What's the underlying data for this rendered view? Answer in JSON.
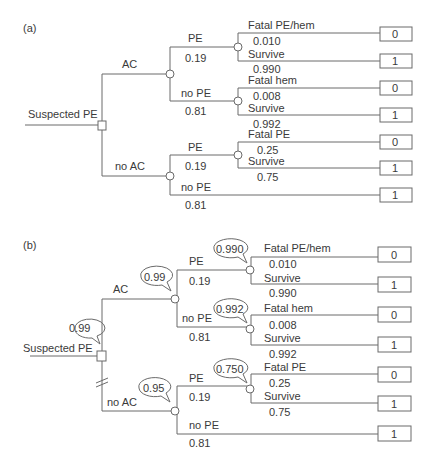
{
  "panels": [
    {
      "label": "(a)",
      "root": "Suspected PE",
      "decision": {
        "branches": [
          {
            "label": "AC"
          },
          {
            "label": "no AC"
          }
        ]
      },
      "ac": {
        "pe": {
          "label": "PE",
          "prob": "0.19",
          "outcomes": [
            {
              "label": "Fatal PE/hem",
              "prob": "0.010",
              "value": "0"
            },
            {
              "label": "Survive",
              "prob": "0.990",
              "value": "1"
            }
          ]
        },
        "nope": {
          "label": "no PE",
          "prob": "0.81",
          "outcomes": [
            {
              "label": "Fatal hem",
              "prob": "0.008",
              "value": "0"
            },
            {
              "label": "Survive",
              "prob": "0.992",
              "value": "1"
            }
          ]
        }
      },
      "noac": {
        "pe": {
          "label": "PE",
          "prob": "0.19",
          "outcomes": [
            {
              "label": "Fatal PE",
              "prob": "0.25",
              "value": "0"
            },
            {
              "label": "Survive",
              "prob": "0.75",
              "value": "1"
            }
          ]
        },
        "nope": {
          "label": "no PE",
          "prob": "0.81",
          "value": "1"
        }
      }
    },
    {
      "label": "(b)",
      "root": "Suspected PE",
      "root_bubble": "0.99",
      "decision": {
        "branches": [
          {
            "label": "AC",
            "bubble": "0.99"
          },
          {
            "label": "no AC",
            "bubble": "0.95",
            "pruned": true
          }
        ]
      },
      "ac": {
        "pe": {
          "label": "PE",
          "prob": "0.19",
          "bubble": "0.990",
          "outcomes": [
            {
              "label": "Fatal PE/hem",
              "prob": "0.010",
              "value": "0"
            },
            {
              "label": "Survive",
              "prob": "0.990",
              "value": "1"
            }
          ]
        },
        "nope": {
          "label": "no PE",
          "prob": "0.81",
          "bubble": "0.992",
          "outcomes": [
            {
              "label": "Fatal hem",
              "prob": "0.008",
              "value": "0"
            },
            {
              "label": "Survive",
              "prob": "0.992",
              "value": "1"
            }
          ]
        }
      },
      "noac": {
        "pe": {
          "label": "PE",
          "prob": "0.19",
          "bubble": "0.750",
          "outcomes": [
            {
              "label": "Fatal PE",
              "prob": "0.25",
              "value": "0"
            },
            {
              "label": "Survive",
              "prob": "0.75",
              "value": "1"
            }
          ]
        },
        "nope": {
          "label": "no PE",
          "prob": "0.81",
          "value": "1"
        }
      }
    }
  ],
  "colors": {
    "line": "#6a6a6a",
    "text": "#3a3a3a"
  }
}
